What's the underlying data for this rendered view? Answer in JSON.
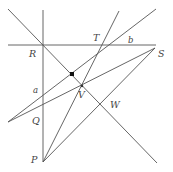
{
  "diagram": {
    "type": "geometry-construction",
    "points": {
      "R": {
        "x": 43,
        "y": 45,
        "label": "R"
      },
      "T": {
        "x": 101,
        "y": 45,
        "label": "T"
      },
      "S": {
        "x": 155,
        "y": 48,
        "label": "S"
      },
      "V": {
        "x": 82,
        "y": 86,
        "label": "V"
      },
      "W": {
        "x": 102,
        "y": 106,
        "label": "W"
      },
      "Q": {
        "x": 43,
        "y": 110,
        "label": "Q"
      },
      "P": {
        "x": 43,
        "y": 162,
        "label": "P"
      },
      "dot": {
        "x": 72,
        "y": 74
      }
    },
    "line_labels": {
      "a": "a",
      "b": "b"
    },
    "labels": {
      "R": "R",
      "T": "T",
      "b": "b",
      "S": "S",
      "a": "a",
      "V": "V",
      "W": "W",
      "Q": "Q",
      "P": "P"
    },
    "colors": {
      "line": "#555555",
      "text": "#444444",
      "dot": "#111111"
    }
  }
}
